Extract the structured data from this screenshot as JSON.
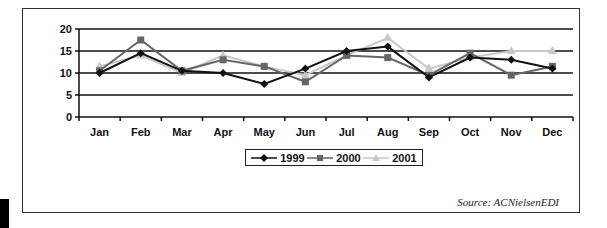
{
  "chart_data": {
    "type": "line",
    "title": "",
    "xlabel": "",
    "ylabel": "",
    "categories": [
      "Jan",
      "Feb",
      "Mar",
      "Apr",
      "May",
      "Jun",
      "Jul",
      "Aug",
      "Sep",
      "Oct",
      "Nov",
      "Dec"
    ],
    "series": [
      {
        "name": "1999",
        "color": "#111111",
        "marker": "diamond",
        "values": [
          10,
          14.5,
          10.5,
          10,
          7.5,
          11,
          15,
          16,
          9,
          13.5,
          13,
          11
        ]
      },
      {
        "name": "2000",
        "color": "#666666",
        "marker": "square",
        "values": [
          10.5,
          17.5,
          10.5,
          13,
          11.5,
          8,
          14,
          13.5,
          9.5,
          14.5,
          9.5,
          11.5
        ]
      },
      {
        "name": "2001",
        "color": "#c8c8c8",
        "marker": "triangle",
        "values": [
          11.5,
          14,
          10,
          14,
          11.5,
          9.5,
          14,
          18,
          11,
          13.5,
          15,
          15
        ]
      }
    ],
    "ylim": [
      0,
      20
    ],
    "yticks": [
      0,
      5,
      10,
      15,
      20
    ],
    "grid": true,
    "legend_position": "bottom"
  },
  "legend": {
    "items": [
      "1999",
      "2000",
      "2001"
    ]
  },
  "source": "Source: ACNielsenEDI"
}
